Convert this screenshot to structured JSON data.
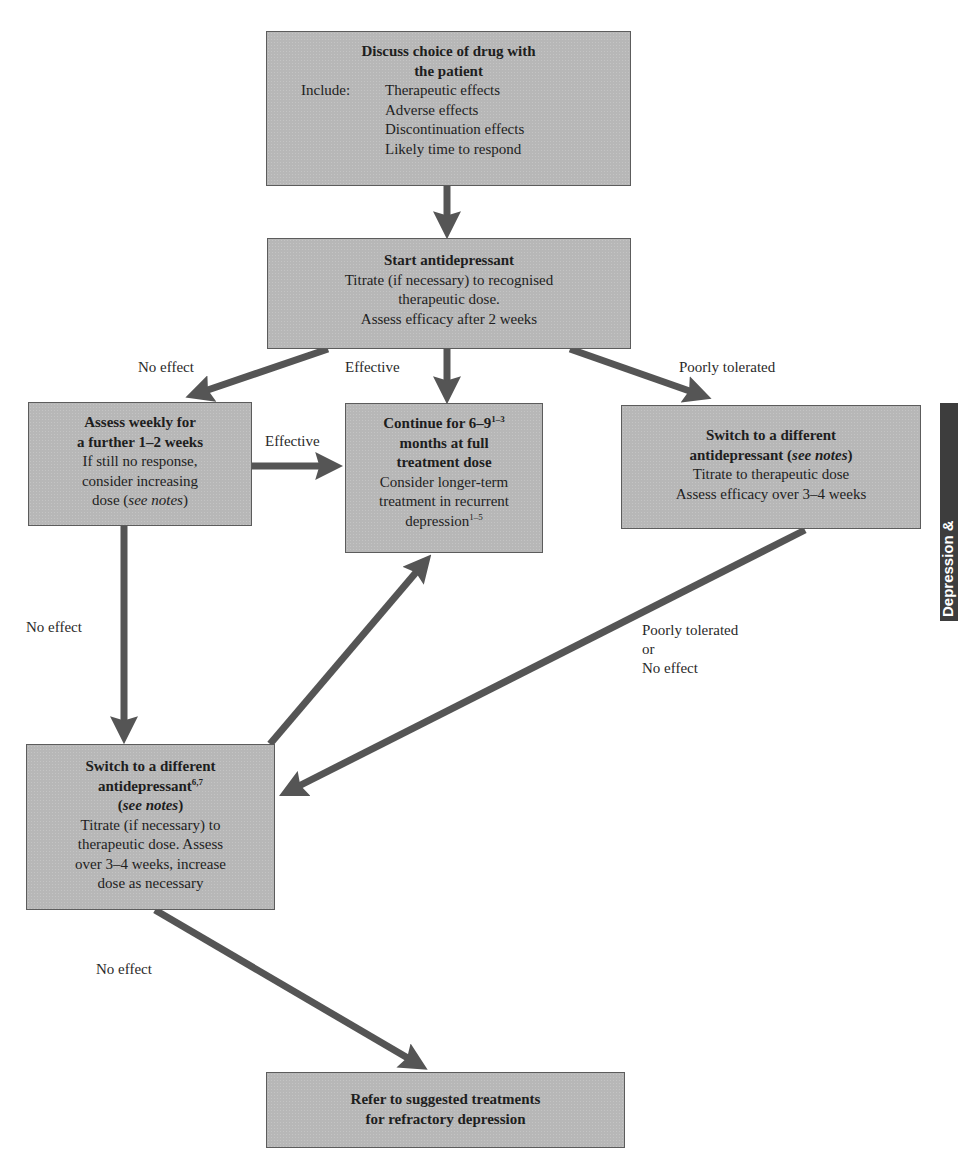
{
  "colors": {
    "box_fill": "#b7b7b7",
    "box_border": "#5c5c5c",
    "arrow": "#555555",
    "side_tab": "#3d3d3d"
  },
  "side_tab": {
    "text": "Depression &"
  },
  "boxes": {
    "discuss": {
      "title_line1": "Discuss choice of drug with",
      "title_line2": "the patient",
      "include_label": "Include:",
      "include_items": [
        "Therapeutic effects",
        "Adverse effects",
        "Discontinuation effects",
        "Likely time to respond"
      ]
    },
    "start": {
      "title": "Start antidepressant",
      "line1": "Titrate (if necessary) to recognised",
      "line2": "therapeutic dose.",
      "line3": "Assess efficacy after 2 weeks"
    },
    "assess_weekly": {
      "title_line1": "Assess weekly for",
      "title_line2": "a further 1–2 weeks",
      "line1": "If still no response,",
      "line2": "consider increasing",
      "line3_prefix": "dose (",
      "line3_italic": "see notes",
      "line3_suffix": ")"
    },
    "continue": {
      "title_line1": "Continue for 6–9",
      "title_line1_sup": "1–3",
      "title_line2": "months at full",
      "title_line3": "treatment dose",
      "line1": "Consider longer-term",
      "line2": "treatment in recurrent",
      "line3": "depression",
      "line3_sup": "1–5"
    },
    "switch_right": {
      "title_line1": "Switch to a different",
      "title_line2_prefix": "antidepressant (",
      "title_line2_italic": "see notes",
      "title_line2_suffix": ")",
      "line1": "Titrate to therapeutic dose",
      "line2": "Assess efficacy over 3–4 weeks"
    },
    "switch_left": {
      "title_line1": "Switch to a different",
      "title_line2": "antidepressant",
      "title_line2_sup": "6,7",
      "title_line3_prefix": "(",
      "title_line3_italic": "see notes",
      "title_line3_suffix": ")",
      "line1": "Titrate (if necessary) to",
      "line2": "therapeutic dose. Assess",
      "line3": "over 3–4 weeks, increase",
      "line4": "dose as necessary"
    },
    "refer": {
      "line1": "Refer to suggested treatments",
      "line2": "for refractory depression"
    }
  },
  "edge_labels": {
    "start_no_effect": "No effect",
    "start_effective": "Effective",
    "start_poorly_tolerated": "Poorly tolerated",
    "assess_effective": "Effective",
    "assess_no_effect": "No effect",
    "switch_right_line1": "Poorly tolerated",
    "switch_right_line2": "or",
    "switch_right_line3": "No effect",
    "switch_left_no_effect": "No effect"
  }
}
